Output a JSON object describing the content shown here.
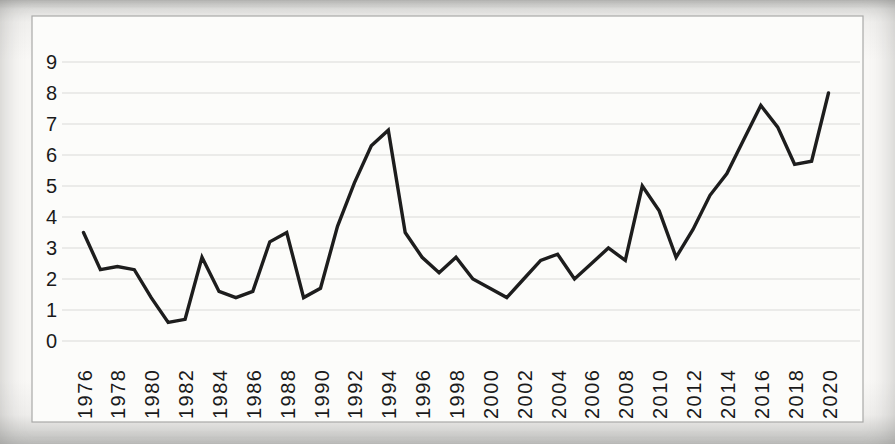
{
  "figure": {
    "kind": "photographed spreadsheet line chart",
    "plot_background": "#fcfcfa",
    "border_color": "#a9a9a7",
    "gridline_color": "#dadad8",
    "line_color": "#1d1d1d",
    "label_color": "#1a1a1a"
  },
  "chart_data": {
    "type": "line",
    "title": "",
    "xlabel": "",
    "ylabel": "",
    "x": [
      1976,
      1977,
      1978,
      1979,
      1980,
      1981,
      1982,
      1983,
      1984,
      1985,
      1986,
      1987,
      1988,
      1989,
      1990,
      1991,
      1992,
      1993,
      1994,
      1995,
      1996,
      1997,
      1998,
      1999,
      2000,
      2001,
      2002,
      2003,
      2004,
      2005,
      2006,
      2007,
      2008,
      2009,
      2010,
      2011,
      2012,
      2013,
      2014,
      2015,
      2016,
      2017,
      2018,
      2019,
      2020
    ],
    "series": [
      {
        "name": "",
        "values": [
          3.5,
          2.3,
          2.4,
          2.3,
          1.4,
          0.6,
          0.7,
          2.7,
          1.6,
          1.4,
          1.6,
          3.2,
          3.5,
          1.4,
          1.7,
          3.7,
          5.1,
          6.3,
          6.8,
          3.5,
          2.7,
          2.2,
          2.7,
          2.0,
          1.7,
          1.4,
          2.0,
          2.6,
          2.8,
          2.0,
          2.5,
          3.0,
          2.6,
          5.0,
          4.2,
          2.7,
          3.6,
          4.7,
          5.4,
          6.5,
          7.6,
          6.9,
          5.7,
          5.8,
          8.0
        ]
      }
    ],
    "x_tick_labels": [
      "1976",
      "1978",
      "1980",
      "1982",
      "1984",
      "1986",
      "1988",
      "1990",
      "1992",
      "1994",
      "1996",
      "1998",
      "2000",
      "2002",
      "2004",
      "2006",
      "2008",
      "2010",
      "2012",
      "2014",
      "2016",
      "2018",
      "2020"
    ],
    "y_tick_labels": [
      "0",
      "1",
      "2",
      "3",
      "4",
      "5",
      "6",
      "7",
      "8",
      "9"
    ],
    "ylim": [
      0,
      9
    ],
    "xlim": [
      1976,
      2020
    ],
    "grid": true,
    "legend_position": "none"
  }
}
